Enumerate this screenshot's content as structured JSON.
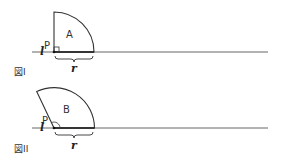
{
  "figures": [
    {
      "caption": "図I",
      "line_label": "l",
      "point_label": "P",
      "region_label": "A",
      "radius_label": "r",
      "shape": "quarter-circle sector, right angle at P"
    },
    {
      "caption": "図II",
      "line_label": "l",
      "point_label": "P",
      "region_label": "B",
      "radius_label": "r",
      "shape": "circular sector rotated, obtuse angle at P"
    }
  ],
  "colors": {
    "stroke": "#333333",
    "line": "#666666",
    "background": "#ffffff"
  }
}
